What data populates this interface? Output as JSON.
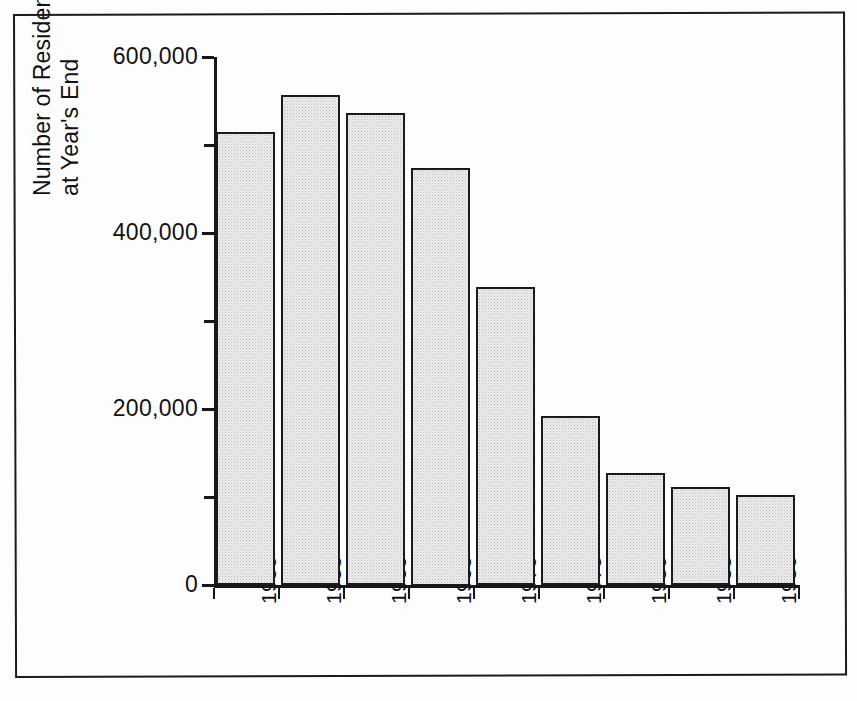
{
  "figure": {
    "border_color": "#1b1b1b",
    "background": "#ffffff"
  },
  "axis_title": {
    "line1": "Number of Resident-Patients",
    "line2": "at Year's End"
  },
  "y_ticks": [
    {
      "label": "600,000",
      "value": 600000,
      "major": true
    },
    {
      "label": "",
      "value": 500000,
      "major": false
    },
    {
      "label": "400,000",
      "value": 400000,
      "major": true
    },
    {
      "label": "",
      "value": 300000,
      "major": false
    },
    {
      "label": "200,000",
      "value": 200000,
      "major": true
    },
    {
      "label": "",
      "value": 100000,
      "major": false
    },
    {
      "label": "0",
      "value": 0,
      "major": true
    }
  ],
  "chart_data": {
    "type": "bar",
    "title": "",
    "subtitle": "",
    "xlabel": "",
    "ylabel": "Number of Resident-Patients at Year's End",
    "categories": [
      "1950",
      "1955",
      "1960",
      "1965",
      "1970",
      "1975",
      "1980",
      "1985",
      "1986"
    ],
    "values": [
      515000,
      557000,
      537000,
      475000,
      339000,
      193000,
      128000,
      112000,
      103000
    ],
    "ylim": [
      0,
      600000
    ],
    "ytick_values": [
      0,
      100000,
      200000,
      300000,
      400000,
      500000,
      600000
    ],
    "ytick_labels": [
      "0",
      "",
      "200,000",
      "",
      "400,000",
      "",
      "600,000"
    ],
    "grid": false,
    "legend": "none",
    "bar_fill": "#ededed",
    "bar_edge": "#1a1a1a",
    "xtick_label_rotation": 90
  }
}
